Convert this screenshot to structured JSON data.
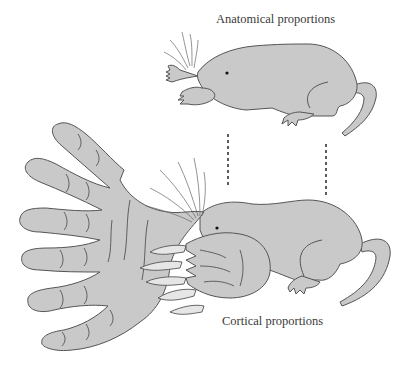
{
  "labels": {
    "anatomical": "Anatomical proportions",
    "cortical": "Cortical proportions"
  },
  "figures": [
    {
      "name": "mole-anatomical",
      "description": "Star-nosed mole drawn with true anatomical proportions"
    },
    {
      "name": "mole-cortical",
      "description": "Star-nosed mole drawn with body parts scaled to cortical representation, with enormous star-shaped nose appendages"
    }
  ],
  "colors": {
    "fill": "#c9c9c9",
    "stroke": "#555555",
    "claw_fill": "#e6e6e6",
    "text": "#3a3a3a"
  }
}
